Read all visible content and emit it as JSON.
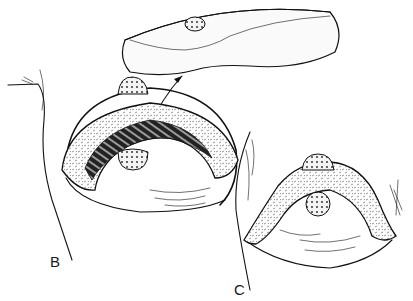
{
  "figure": {
    "panels": [
      {
        "id": "B",
        "label": "B",
        "description": "Excision of tissue wedge beneath nipple-areola; specimen lifted away (arrow)"
      },
      {
        "id": "C",
        "label": "C",
        "description": "Closure after resection with nipple-areola repositioned"
      }
    ]
  }
}
